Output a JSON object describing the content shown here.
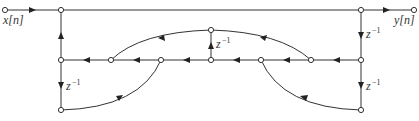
{
  "diagram": {
    "type": "signal-flow-graph",
    "input_label": "x[n]",
    "output_label": "y[n]",
    "delay_label": "z",
    "delay_exponent": "−1",
    "nodes": [
      {
        "id": "in"
      },
      {
        "id": "a"
      },
      {
        "id": "b"
      },
      {
        "id": "out"
      },
      {
        "id": "m1"
      },
      {
        "id": "m2"
      },
      {
        "id": "m3"
      },
      {
        "id": "m4"
      },
      {
        "id": "m5"
      },
      {
        "id": "m6"
      },
      {
        "id": "m7"
      },
      {
        "id": "u"
      },
      {
        "id": "l1"
      },
      {
        "id": "r1"
      }
    ],
    "edges": [
      {
        "from": "in",
        "to": "a",
        "kind": "branch"
      },
      {
        "from": "a",
        "to": "b",
        "kind": "branch"
      },
      {
        "from": "b",
        "to": "out",
        "kind": "branch"
      },
      {
        "from": "b",
        "to": "m7",
        "kind": "delay"
      },
      {
        "from": "m7",
        "to": "r1",
        "kind": "delay"
      },
      {
        "from": "m7",
        "to": "m6",
        "kind": "branch"
      },
      {
        "from": "m6",
        "to": "m5",
        "kind": "branch"
      },
      {
        "from": "m5",
        "to": "m4",
        "kind": "branch"
      },
      {
        "from": "m4",
        "to": "m3",
        "kind": "branch"
      },
      {
        "from": "m3",
        "to": "m2",
        "kind": "branch"
      },
      {
        "from": "m2",
        "to": "m1",
        "kind": "branch"
      },
      {
        "from": "m1",
        "to": "a",
        "kind": "branch"
      },
      {
        "from": "m1",
        "to": "l1",
        "kind": "delay"
      },
      {
        "from": "m4",
        "to": "u",
        "kind": "delay"
      },
      {
        "from": "m6",
        "to": "u",
        "kind": "arc"
      },
      {
        "from": "u",
        "to": "m2",
        "kind": "arc"
      },
      {
        "from": "l1",
        "to": "m3",
        "kind": "arc"
      },
      {
        "from": "r1",
        "to": "m5",
        "kind": "arc"
      }
    ]
  }
}
